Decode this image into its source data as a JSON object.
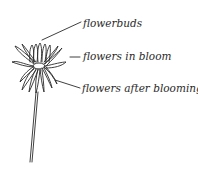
{
  "diagram": {
    "labels": [
      {
        "id": "flowerbuds",
        "text": "flowerbuds"
      },
      {
        "id": "in-bloom",
        "text": "flowers in bloom"
      },
      {
        "id": "after-blooming",
        "text": "flowers after blooming"
      }
    ],
    "colors": {
      "ink": "#2a2a2a",
      "background": "#ffffff"
    }
  }
}
